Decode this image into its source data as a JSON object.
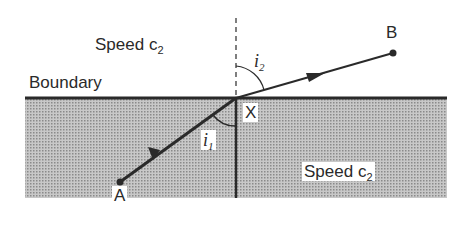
{
  "diagram": {
    "type": "refraction-diagram",
    "upper_medium": {
      "label": "Speed c",
      "subscript": "2"
    },
    "lower_medium": {
      "label": "Speed c",
      "subscript": "2"
    },
    "boundary_label": "Boundary",
    "points": {
      "A": {
        "label": "A",
        "x": 120,
        "y": 182
      },
      "X": {
        "label": "X",
        "x": 236,
        "y": 98
      },
      "B": {
        "label": "B",
        "x": 393,
        "y": 53
      }
    },
    "angles": {
      "incidence": {
        "symbol": "i",
        "subscript": "1"
      },
      "refraction": {
        "symbol": "i",
        "subscript": "2"
      }
    },
    "colors": {
      "shade": "#b4b4b4",
      "line": "#2a2a2a",
      "background": "#ffffff"
    }
  }
}
